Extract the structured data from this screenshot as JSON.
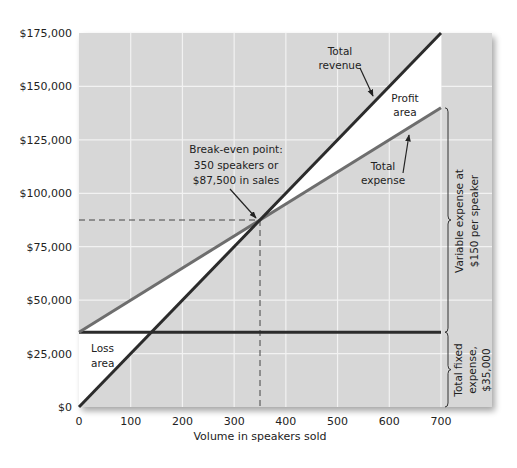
{
  "chart_data": {
    "type": "line",
    "title": "",
    "xlabel": "Volume in speakers sold",
    "ylabel": "",
    "xlim": [
      0,
      700
    ],
    "ylim": [
      0,
      175000
    ],
    "grid": true,
    "x_ticks": [
      0,
      100,
      200,
      300,
      400,
      500,
      600,
      700
    ],
    "x_tick_labels": [
      "0",
      "100",
      "200",
      "300",
      "400",
      "500",
      "600",
      "700"
    ],
    "y_ticks": [
      0,
      25000,
      50000,
      75000,
      100000,
      125000,
      150000,
      175000
    ],
    "y_tick_labels": [
      "$0",
      "$25,000",
      "$50,000",
      "$75,000",
      "$100,000",
      "$125,000",
      "$150,000",
      "$175,000"
    ],
    "series": [
      {
        "name": "Total revenue",
        "x": [
          0,
          700
        ],
        "values": [
          0,
          175000
        ],
        "color": "#2b2b2b"
      },
      {
        "name": "Total expense",
        "x": [
          0,
          700
        ],
        "values": [
          35000,
          140000
        ],
        "color": "#6e6e6e"
      },
      {
        "name": "Total fixed expense",
        "x": [
          0,
          700
        ],
        "values": [
          35000,
          35000
        ],
        "color": "#2b2b2b"
      }
    ],
    "break_even": {
      "x": 350,
      "y": 87500
    },
    "regions": [
      {
        "name": "Profit area",
        "from_x": 350,
        "to_x": 700
      },
      {
        "name": "Loss area",
        "from_x": 0,
        "to_x": 350
      }
    ],
    "annotations": [
      {
        "id": "revenue",
        "lines": [
          "Total",
          "revenue"
        ]
      },
      {
        "id": "profit",
        "lines": [
          "Profit",
          "area"
        ]
      },
      {
        "id": "expense",
        "lines": [
          "Total",
          "expense"
        ]
      },
      {
        "id": "breakeven",
        "lines": [
          "Break-even point:",
          "350 speakers or",
          "$87,500 in sales"
        ]
      },
      {
        "id": "loss",
        "lines": [
          "Loss",
          "area"
        ]
      },
      {
        "id": "variable",
        "lines": [
          "Variable expense at",
          "$150 per speaker"
        ]
      },
      {
        "id": "fixed",
        "lines": [
          "Total fixed",
          "expense,",
          "$35,000"
        ]
      }
    ]
  },
  "colors": {
    "panel": "#d7d7d7",
    "grid": "#f2f2f2",
    "region": "#ffffff",
    "dark_line": "#2b2b2b",
    "expense_line": "#6e6e6e"
  }
}
